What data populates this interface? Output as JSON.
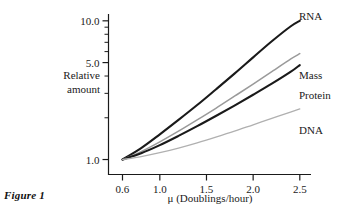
{
  "figure": {
    "caption": "Figure 1"
  },
  "chart_data": {
    "type": "line",
    "title": "",
    "xlabel": "μ (Doublings/hour)",
    "ylabel_line1": "Relative",
    "ylabel_line2": "amount",
    "xscale": "linear",
    "yscale": "log",
    "xlim": [
      0.45,
      2.62
    ],
    "ylim": [
      0.78,
      11.2
    ],
    "grid": false,
    "legend_position": "right-inline-labels",
    "xticks": [
      0.6,
      1.0,
      1.5,
      2.0,
      2.5
    ],
    "xtick_labels": [
      "0.6",
      "1.0",
      "1.5",
      "2.0",
      "2.5"
    ],
    "yticks_major": [
      1.0,
      5.0,
      10.0
    ],
    "ytick_labels": [
      "1.0",
      "5.0",
      "10.0"
    ],
    "yticks_minor": [
      2.0,
      3.0,
      4.0,
      6.0,
      7.0,
      8.0,
      9.0
    ],
    "x": [
      0.6,
      0.8,
      1.0,
      1.2,
      1.4,
      1.6,
      1.8,
      2.0,
      2.2,
      2.4,
      2.5
    ],
    "series": [
      {
        "name": "RNA",
        "label": "RNA",
        "color": "#1a1a1a",
        "width": 2.1,
        "values": [
          1.0,
          1.21,
          1.52,
          1.93,
          2.47,
          3.2,
          4.16,
          5.45,
          7.12,
          9.1,
          10.0
        ]
      },
      {
        "name": "Mass",
        "label": "Mass",
        "color": "#9a9a9a",
        "width": 1.5,
        "values": [
          1.0,
          1.14,
          1.34,
          1.6,
          1.93,
          2.34,
          2.86,
          3.5,
          4.3,
          5.3,
          5.8
        ]
      },
      {
        "name": "Protein",
        "label": "Protein",
        "color": "#1a1a1a",
        "width": 2.1,
        "values": [
          1.0,
          1.11,
          1.27,
          1.48,
          1.74,
          2.06,
          2.45,
          2.93,
          3.52,
          4.28,
          4.8
        ]
      },
      {
        "name": "DNA",
        "label": "DNA",
        "color": "#b0b0b0",
        "width": 1.3,
        "values": [
          1.0,
          1.05,
          1.12,
          1.21,
          1.32,
          1.45,
          1.6,
          1.78,
          1.98,
          2.2,
          2.32
        ]
      }
    ],
    "series_labels": [
      {
        "text": "RNA",
        "x": 299,
        "y": 20
      },
      {
        "text": "Mass",
        "x": 299,
        "y": 79
      },
      {
        "text": "Protein",
        "x": 299,
        "y": 99
      },
      {
        "text": "DNA",
        "x": 299,
        "y": 134
      }
    ],
    "axis_color": "#1a1a1a"
  }
}
